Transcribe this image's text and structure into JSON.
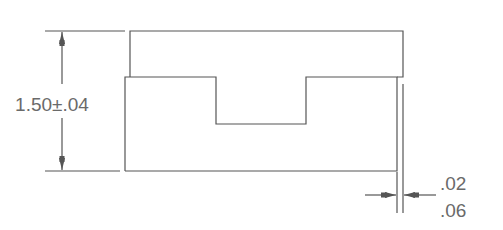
{
  "drawing": {
    "height_dimension": {
      "nominal": "1.50",
      "tolerance": "±.04",
      "label": "1.50±.04"
    },
    "gap_dimension": {
      "upper_label": ".02",
      "lower_label": ".06"
    },
    "colors": {
      "line": "#555555",
      "text": "#6a6a6a",
      "background": "#ffffff"
    }
  }
}
